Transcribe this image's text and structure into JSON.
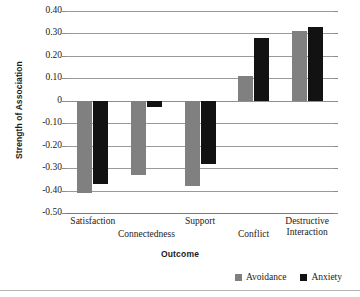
{
  "chart_data": {
    "type": "bar",
    "title": "",
    "xlabel": "Outcome",
    "ylabel": "Strength of Association",
    "categories": [
      "Satisfaction",
      "Connectedness",
      "Support",
      "Conflict",
      "Destructive Interaction"
    ],
    "series": [
      {
        "name": "Avoidance",
        "color": "#808080",
        "values": [
          -0.41,
          -0.33,
          -0.38,
          0.11,
          0.31
        ]
      },
      {
        "name": "Anxiety",
        "color": "#121212",
        "values": [
          -0.37,
          -0.03,
          -0.28,
          0.28,
          0.33
        ]
      }
    ],
    "ylim": [
      -0.5,
      0.4
    ],
    "ytick_values": [
      0.4,
      0.3,
      0.2,
      0.1,
      0,
      -0.1,
      -0.2,
      -0.3,
      -0.4,
      -0.5
    ],
    "ytick_labels": [
      "0.40",
      "0.30",
      "0.20",
      "0.10",
      "0",
      "-0.10",
      "-0.20",
      "-0.30",
      "-0.40",
      "-0.50"
    ],
    "grid": true,
    "legend_position": "bottom-right"
  },
  "legend": {
    "entries": [
      {
        "label": "Avoidance",
        "swatch": "avoidance-swatch"
      },
      {
        "label": "Anxiety",
        "swatch": "anxiety-swatch"
      }
    ]
  }
}
